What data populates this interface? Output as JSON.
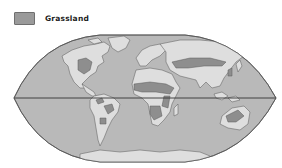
{
  "legend": {
    "items": [
      {
        "label": "Grassland",
        "color": "#9a9a9a"
      }
    ]
  },
  "map": {
    "projection": "elliptical world map",
    "colors": {
      "ocean": "#b9b9b9",
      "land": "#dedede",
      "grassland": "#8e8e8e",
      "outline": "#555555",
      "equator": "#333333"
    },
    "equator_label": "",
    "regions_with_grassland": [
      "North American Great Plains",
      "South American pampas and savanna",
      "African savanna (Sahel band and southern Africa)",
      "Central Asian steppe",
      "Australian grassland"
    ]
  }
}
